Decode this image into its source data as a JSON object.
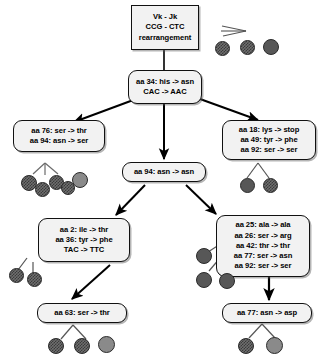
{
  "diagram": {
    "colors": {
      "node_fill": "#f2f2f2",
      "node_border": "#111111",
      "arrow": "#000000",
      "cell_dark": "#575757",
      "cell_mid": "#8a8a8a",
      "cell_check": "#6e6e6e"
    },
    "nodes": [
      {
        "id": "root",
        "shape": "rectangle",
        "lines": [
          "Vk  -   Jk",
          "CCG - CTC",
          "rearrangement"
        ]
      },
      {
        "id": "aa34",
        "shape": "rounded",
        "lines": [
          "aa 34: his -> asn",
          "CAC -> AAC"
        ]
      },
      {
        "id": "left1",
        "shape": "rounded",
        "lines": [
          "aa 76: ser -> thr",
          "aa 94: asn -> ser"
        ]
      },
      {
        "id": "right1",
        "shape": "rounded",
        "lines": [
          "aa 18: lys -> stop",
          "aa 49: tyr -> phe",
          "aa 92: ser -> ser"
        ]
      },
      {
        "id": "center1",
        "shape": "rounded",
        "lines": [
          "aa 94: asn -> asn"
        ]
      },
      {
        "id": "left2",
        "shape": "rounded",
        "lines": [
          "aa 2: ile -> thr",
          "aa 36: tyr -> phe",
          "TAC -> TTC"
        ]
      },
      {
        "id": "right2",
        "shape": "rounded",
        "lines": [
          "aa 25: ala -> ala",
          "aa 26: ser -> arg",
          "aa 42: thr -> thr",
          "aa 77: ser -> asn",
          "aa 92: ser -> ser"
        ]
      },
      {
        "id": "left3",
        "shape": "rounded",
        "lines": [
          "aa 63: ser -> thr"
        ]
      },
      {
        "id": "right3",
        "shape": "rounded",
        "lines": [
          "aa 77: asn -> asp"
        ]
      }
    ],
    "edges": [
      {
        "from": "root",
        "to": "aa34",
        "style": "line"
      },
      {
        "from": "aa34",
        "to": "left1",
        "style": "arrow"
      },
      {
        "from": "aa34",
        "to": "center1",
        "style": "arrow"
      },
      {
        "from": "aa34",
        "to": "right1",
        "style": "arrow"
      },
      {
        "from": "center1",
        "to": "left2",
        "style": "arrow"
      },
      {
        "from": "center1",
        "to": "right2",
        "style": "arrow"
      },
      {
        "from": "left2",
        "to": "left3",
        "style": "arrow"
      },
      {
        "from": "right2",
        "to": "right3",
        "style": "arrow"
      }
    ],
    "cell_clusters": [
      {
        "id": "cells-root",
        "attached_to": "root",
        "count": 3
      },
      {
        "id": "cells-left1",
        "attached_to": "left1",
        "count": 5
      },
      {
        "id": "cells-right1",
        "attached_to": "right1",
        "count": 2
      },
      {
        "id": "cells-left2",
        "attached_to": "left2",
        "count": 2
      },
      {
        "id": "cells-right2",
        "attached_to": "right2",
        "count": 3
      },
      {
        "id": "cells-left3",
        "attached_to": "left3",
        "count": 3
      },
      {
        "id": "cells-right3",
        "attached_to": "right3",
        "count": 2
      }
    ]
  }
}
